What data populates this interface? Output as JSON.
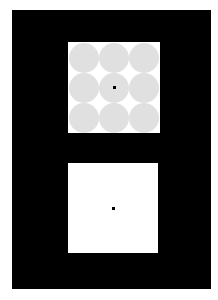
{
  "background_color": "#000000",
  "stimulus_top": {
    "background": "#ffffff",
    "circle_color": "#e0e0e0",
    "grid_rows": 3,
    "grid_cols": 3,
    "fixation_dot": "center"
  },
  "stimulus_bottom": {
    "background": "#ffffff",
    "fixation_dot": "center"
  }
}
